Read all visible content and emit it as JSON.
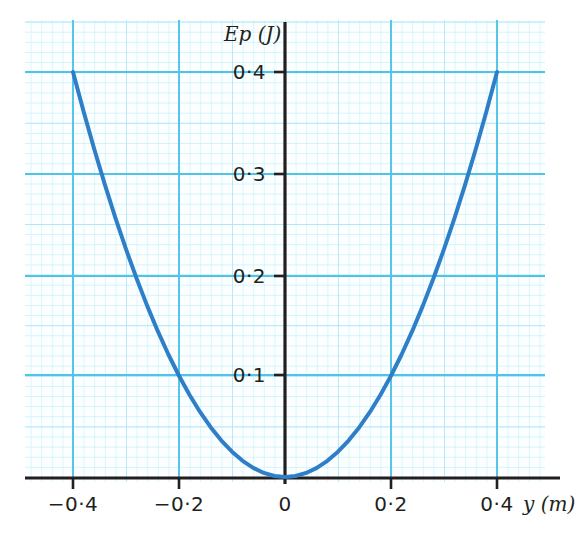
{
  "chart_data": {
    "type": "line",
    "title": "",
    "subtitle": "",
    "xlabel": "y (m)",
    "ylabel": "Ep (J)",
    "xlim": [
      -0.5,
      0.49
    ],
    "ylim": [
      -0.012,
      0.44
    ],
    "grid": true,
    "grid_minor_step_x": 0.02,
    "grid_minor_step_y": 0.01,
    "grid_major_step_x": 0.2,
    "grid_major_step_y": 0.1,
    "legend": "none",
    "annotations": [],
    "relation": "Ep = 2.5 * y^2",
    "x_ticks": [
      -0.4,
      -0.2,
      0,
      0.2,
      0.4
    ],
    "x_tick_labels": [
      "−0·4",
      "−0·2",
      "0",
      "0·2",
      "0·4"
    ],
    "y_ticks": [
      0.1,
      0.2,
      0.3,
      0.4
    ],
    "y_tick_labels": [
      "0·1",
      "0·2",
      "0·3",
      "0·4"
    ],
    "series": [
      {
        "name": "Ep(y)",
        "color": "#2f7fc8",
        "x": [
          -0.4,
          -0.38,
          -0.36,
          -0.34,
          -0.32,
          -0.3,
          -0.28,
          -0.26,
          -0.24,
          -0.22,
          -0.2,
          -0.18,
          -0.16,
          -0.14,
          -0.12,
          -0.1,
          -0.08,
          -0.06,
          -0.04,
          -0.02,
          0,
          0.02,
          0.04,
          0.06,
          0.08,
          0.1,
          0.12,
          0.14,
          0.16,
          0.18,
          0.2,
          0.22,
          0.24,
          0.26,
          0.28,
          0.3,
          0.32,
          0.34,
          0.36,
          0.38,
          0.4
        ],
        "y": [
          0.4,
          0.361,
          0.324,
          0.289,
          0.256,
          0.225,
          0.196,
          0.169,
          0.144,
          0.121,
          0.1,
          0.081,
          0.064,
          0.049,
          0.036,
          0.025,
          0.016,
          0.009,
          0.004,
          0.001,
          0,
          0.001,
          0.004,
          0.009,
          0.016,
          0.025,
          0.036,
          0.049,
          0.064,
          0.081,
          0.1,
          0.121,
          0.144,
          0.169,
          0.196,
          0.225,
          0.256,
          0.289,
          0.324,
          0.361,
          0.4
        ]
      }
    ]
  },
  "axes": {
    "y_axis_label": "Ep (J)",
    "x_axis_label": "y (m)",
    "origin_label": "0"
  },
  "colors": {
    "curve": "#2f7fc8",
    "grid_minor": "#c9eefa",
    "grid_major": "#4fc4e8",
    "axis": "#231f20",
    "text": "#231f20",
    "background": "#ffffff"
  }
}
